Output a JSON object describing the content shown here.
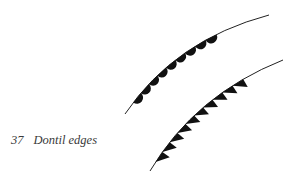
{
  "figure": {
    "number": "37",
    "caption": "Dontil edges",
    "ink_color": "#111111",
    "background": "#ffffff",
    "items": [
      {
        "name": "scalloped-dontil-edge",
        "shape": "semicircle scallops",
        "count": 9
      },
      {
        "name": "triangular-dontil-edge",
        "shape": "triangular teeth",
        "count": 10
      }
    ]
  }
}
